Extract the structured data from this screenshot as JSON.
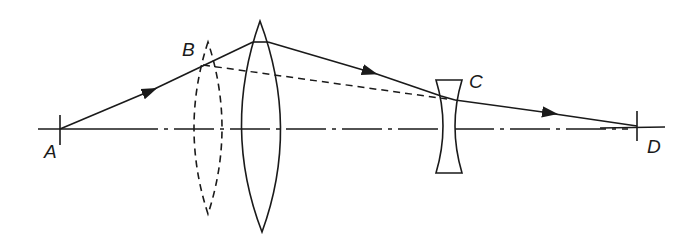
{
  "diagram": {
    "type": "optics-ray-diagram",
    "points": {
      "A": {
        "label": "A"
      },
      "B": {
        "label": "B"
      },
      "C": {
        "label": "C"
      },
      "D": {
        "label": "D"
      }
    },
    "elements": [
      {
        "name": "optical-axis",
        "style": "dash-dot"
      },
      {
        "name": "converging-lens",
        "style": "solid",
        "kind": "biconvex"
      },
      {
        "name": "converging-lens-alternate-position",
        "style": "dashed",
        "kind": "biconvex"
      },
      {
        "name": "diverging-lens",
        "style": "solid",
        "kind": "biconcave"
      },
      {
        "name": "ray",
        "path": "A → top of converging lens → C → D",
        "arrows": 3
      },
      {
        "name": "ray-dashed",
        "path": "B → C"
      }
    ],
    "colors": {
      "stroke": "#1a1a1a",
      "background": "#ffffff"
    }
  }
}
